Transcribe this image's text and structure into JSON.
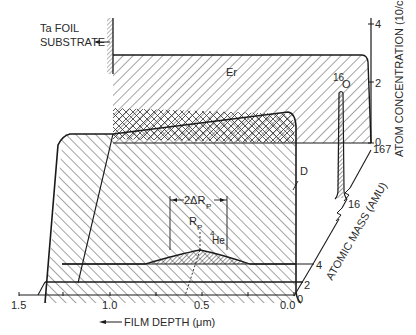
{
  "figure": {
    "substrate_label_line1": "Ta FOIL",
    "substrate_label_line2": "SUBSTRATE",
    "species": {
      "erbium": "Er",
      "deuterium": "D",
      "oxygen_mass": "16",
      "oxygen_symbol": "O",
      "helium_mass": "4",
      "helium_symbol": "He"
    },
    "annotations": {
      "straggling": "2ΔR",
      "straggling_sub": "P",
      "range": "R",
      "range_sub": "P"
    },
    "x_axis": {
      "label": "FILM DEPTH (μm)",
      "ticks": [
        "1.5",
        "1.0",
        "0.5",
        "0.0"
      ]
    },
    "z_axis": {
      "label": "ATOM CONCENTRATION (10/cm",
      "label_sup": "3",
      "label_end": ")",
      "ticks": [
        "0",
        "2",
        "4"
      ]
    },
    "mass_axis": {
      "label": "ATOMIC MASS (AMU)",
      "ticks": [
        "0",
        "2",
        "4",
        "16",
        "167"
      ]
    }
  }
}
